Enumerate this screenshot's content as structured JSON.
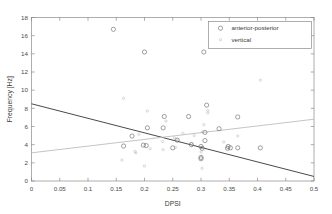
{
  "chart_data": {
    "type": "scatter",
    "title": "",
    "xlabel": "DPSI",
    "ylabel": "Frequency [Hz]",
    "xlim": [
      0,
      0.5
    ],
    "ylim": [
      0,
      18
    ],
    "xticks": [
      0,
      0.05,
      0.1,
      0.15,
      0.2,
      0.25,
      0.3,
      0.35,
      0.4,
      0.45,
      0.5
    ],
    "xticklabels": [
      "0",
      "0.05",
      "0.1",
      "0.15",
      "0.2",
      "0.25",
      "0.3",
      "0.35",
      "0.4",
      "0.45",
      "0.5"
    ],
    "yticks": [
      0,
      2,
      4,
      6,
      8,
      10,
      12,
      14,
      16,
      18
    ],
    "yticklabels": [
      "0",
      "2",
      "4",
      "6",
      "8",
      "10",
      "12",
      "14",
      "16",
      "18"
    ],
    "grid": false,
    "legend": {
      "position": "top-right",
      "boxed": true,
      "entries": [
        {
          "name": "anterior-posterior",
          "marker": "open-circle",
          "color": "#6e6e6e"
        },
        {
          "name": "vertical",
          "marker": "small-dot",
          "color": "#bdbdbd"
        }
      ]
    },
    "series": [
      {
        "name": "anterior-posterior",
        "marker": "open-circle",
        "color": "#6e6e6e",
        "points": [
          [
            0.145,
            16.7
          ],
          [
            0.2,
            14.2
          ],
          [
            0.305,
            14.2
          ],
          [
            0.31,
            8.35
          ],
          [
            0.235,
            7.1
          ],
          [
            0.278,
            7.1
          ],
          [
            0.365,
            7.05
          ],
          [
            0.205,
            5.85
          ],
          [
            0.233,
            5.85
          ],
          [
            0.332,
            5.75
          ],
          [
            0.307,
            5.35
          ],
          [
            0.178,
            4.95
          ],
          [
            0.307,
            4.45
          ],
          [
            0.258,
            4.5
          ],
          [
            0.283,
            4.0
          ],
          [
            0.198,
            3.95
          ],
          [
            0.203,
            3.9
          ],
          [
            0.163,
            3.85
          ],
          [
            0.3,
            3.8
          ],
          [
            0.348,
            3.8
          ],
          [
            0.352,
            3.65
          ],
          [
            0.365,
            3.65
          ],
          [
            0.405,
            3.65
          ],
          [
            0.25,
            3.65
          ],
          [
            0.302,
            3.6
          ],
          [
            0.347,
            3.6
          ],
          [
            0.3,
            2.6
          ],
          [
            0.3,
            2.45
          ]
        ]
      },
      {
        "name": "vertical",
        "marker": "small-dot",
        "color": "#bdbdbd",
        "points": [
          [
            0.405,
            11.1
          ],
          [
            0.163,
            9.1
          ],
          [
            0.205,
            7.7
          ],
          [
            0.312,
            7.75
          ],
          [
            0.312,
            7.5
          ],
          [
            0.238,
            6.6
          ],
          [
            0.305,
            6.2
          ],
          [
            0.302,
            5.4
          ],
          [
            0.268,
            5.25
          ],
          [
            0.288,
            5.0
          ],
          [
            0.365,
            4.95
          ],
          [
            0.19,
            5.15
          ],
          [
            0.253,
            4.75
          ],
          [
            0.232,
            4.35
          ],
          [
            0.258,
            4.5
          ],
          [
            0.34,
            4.3
          ],
          [
            0.283,
            4.15
          ],
          [
            0.21,
            3.55
          ],
          [
            0.233,
            3.45
          ],
          [
            0.183,
            3.25
          ],
          [
            0.185,
            3.1
          ],
          [
            0.255,
            3.7
          ],
          [
            0.3,
            3.2
          ],
          [
            0.16,
            2.3
          ],
          [
            0.2,
            1.65
          ],
          [
            0.302,
            1.4
          ]
        ]
      }
    ],
    "trendlines": [
      {
        "name": "anterior-posterior-fit",
        "color": "#4a4a4a",
        "style": "solid",
        "x": [
          0.0,
          0.5
        ],
        "y": [
          8.5,
          0.5
        ]
      },
      {
        "name": "vertical-fit",
        "color": "#b9b9b9",
        "style": "solid",
        "x": [
          0.0,
          0.5
        ],
        "y": [
          3.1,
          6.8
        ]
      }
    ]
  }
}
